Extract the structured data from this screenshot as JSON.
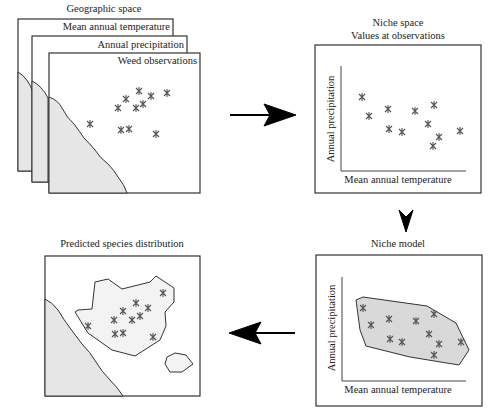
{
  "geographic": {
    "title": "Geographic space",
    "layers": [
      "Mean annual temperature",
      "Annual precipitation",
      "Weed observations"
    ]
  },
  "niche_space": {
    "title_line1": "Niche space",
    "title_line2": "Values at observations",
    "xlabel": "Mean annual temperature",
    "ylabel": "Annual precipitation"
  },
  "niche_model": {
    "title": "Niche model",
    "xlabel": "Mean annual temperature",
    "ylabel": "Annual precipitation"
  },
  "predicted": {
    "title": "Predicted species distribution"
  },
  "colors": {
    "land": "#e6e6e6",
    "hull": "#d9d9d9",
    "marker": "#555555",
    "arrow": "#000000"
  },
  "observations_geo": [
    [
      90,
      124
    ],
    [
      118,
      108
    ],
    [
      126,
      99
    ],
    [
      139,
      91
    ],
    [
      151,
      96
    ],
    [
      143,
      104
    ],
    [
      136,
      108
    ],
    [
      121,
      130
    ],
    [
      129,
      129
    ],
    [
      156,
      134
    ],
    [
      167,
      93
    ]
  ],
  "observations_niche": [
    [
      362,
      97
    ],
    [
      369,
      116
    ],
    [
      388,
      110
    ],
    [
      389,
      129
    ],
    [
      402,
      132
    ],
    [
      415,
      111
    ],
    [
      434,
      105
    ],
    [
      428,
      124
    ],
    [
      439,
      137
    ],
    [
      433,
      146
    ],
    [
      460,
      131
    ]
  ]
}
